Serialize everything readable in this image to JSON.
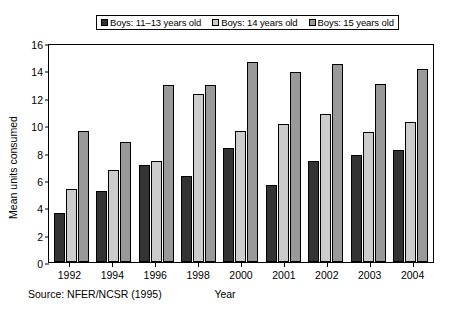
{
  "chart_data": {
    "type": "bar",
    "title": "",
    "xlabel": "Year",
    "ylabel": "Mean units consumed",
    "categories": [
      "1992",
      "1994",
      "1996",
      "1998",
      "2000",
      "2001",
      "2002",
      "2003",
      "2004"
    ],
    "ylim": [
      0,
      16
    ],
    "yticks": [
      "0",
      "2",
      "4",
      "6",
      "8",
      "10",
      "12",
      "14",
      "16"
    ],
    "grid": false,
    "legend_position": "top",
    "series": [
      {
        "name": "Boys: 11–13 years old",
        "color": "#333333",
        "values": [
          3.6,
          5.2,
          7.1,
          6.25,
          8.3,
          5.6,
          7.4,
          7.8,
          8.2
        ]
      },
      {
        "name": "Boys: 14 years old",
        "color": "#cccccc",
        "values": [
          5.3,
          6.7,
          7.35,
          12.3,
          9.55,
          10.1,
          10.8,
          9.5,
          10.25
        ]
      },
      {
        "name": "Boys: 15 years old",
        "color": "#999999",
        "values": [
          9.6,
          8.75,
          12.9,
          12.95,
          14.6,
          13.9,
          14.45,
          13.0,
          14.1
        ]
      }
    ],
    "source_note": "Source: NFER/NCSR (1995)"
  }
}
